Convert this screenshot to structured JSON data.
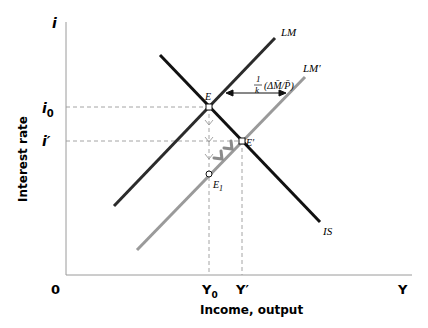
{
  "figure": {
    "axes": {
      "y_symbol": "i",
      "x_symbol": "Y",
      "origin": "0",
      "y_label": "Interest rate",
      "x_label": "Income, output"
    },
    "ticks": {
      "i0": "i",
      "i0_sub": "0",
      "i_prime": "i′",
      "y0": "Y",
      "y0_sub": "0",
      "y_prime": "Y′"
    },
    "curves": {
      "lm": "LM",
      "lm_prime": "LM′",
      "is": "IS"
    },
    "points": {
      "e": "E",
      "e_prime": "E′",
      "e1": "E",
      "e1_sub": "1"
    },
    "shift_label": {
      "numerator": "1",
      "denominator": "k",
      "expr": "(ΔM̄/P̄)"
    },
    "colors": {
      "lm": "#2b2b2b",
      "lm_prime": "#9a9a9a",
      "is": "#111111",
      "axis": "#9a9a9a",
      "dashed": "#9a9a9a"
    }
  }
}
